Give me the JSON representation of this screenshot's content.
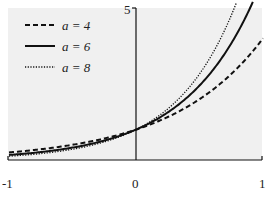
{
  "chart_data": {
    "type": "line",
    "title": "",
    "xlabel": "",
    "ylabel": "",
    "function": "y = a^x",
    "xlim": [
      -1,
      1
    ],
    "ylim": [
      0,
      5
    ],
    "grid": false,
    "legend_position": "upper-left",
    "x_ticks": [
      "-1",
      "0",
      "1"
    ],
    "y_ticks": [
      "5"
    ],
    "x": [
      -1,
      -0.75,
      -0.5,
      -0.25,
      0,
      0.25,
      0.5,
      0.75,
      1
    ],
    "series": [
      {
        "name": "a = 4",
        "style": "dashed",
        "values": [
          0.25,
          0.354,
          0.5,
          0.707,
          1,
          1.414,
          2,
          2.828,
          4
        ]
      },
      {
        "name": "a = 6",
        "style": "solid",
        "values": [
          0.167,
          0.261,
          0.408,
          0.639,
          1,
          1.565,
          2.449,
          3.834,
          6
        ]
      },
      {
        "name": "a = 8",
        "style": "dotted",
        "values": [
          0.125,
          0.21,
          0.354,
          0.595,
          1,
          1.682,
          2.828,
          4.757,
          8
        ]
      }
    ]
  },
  "legend": [
    {
      "label": "a = 4",
      "style": "dashed"
    },
    {
      "label": "a = 6",
      "style": "solid"
    },
    {
      "label": "a = 8",
      "style": "dotted"
    }
  ],
  "axis": {
    "x_left": "-1",
    "x_mid": "0",
    "x_right": "1",
    "y_top": "5"
  },
  "colors": {
    "plot_bg": "#f0f0f0",
    "line": "#111111"
  }
}
